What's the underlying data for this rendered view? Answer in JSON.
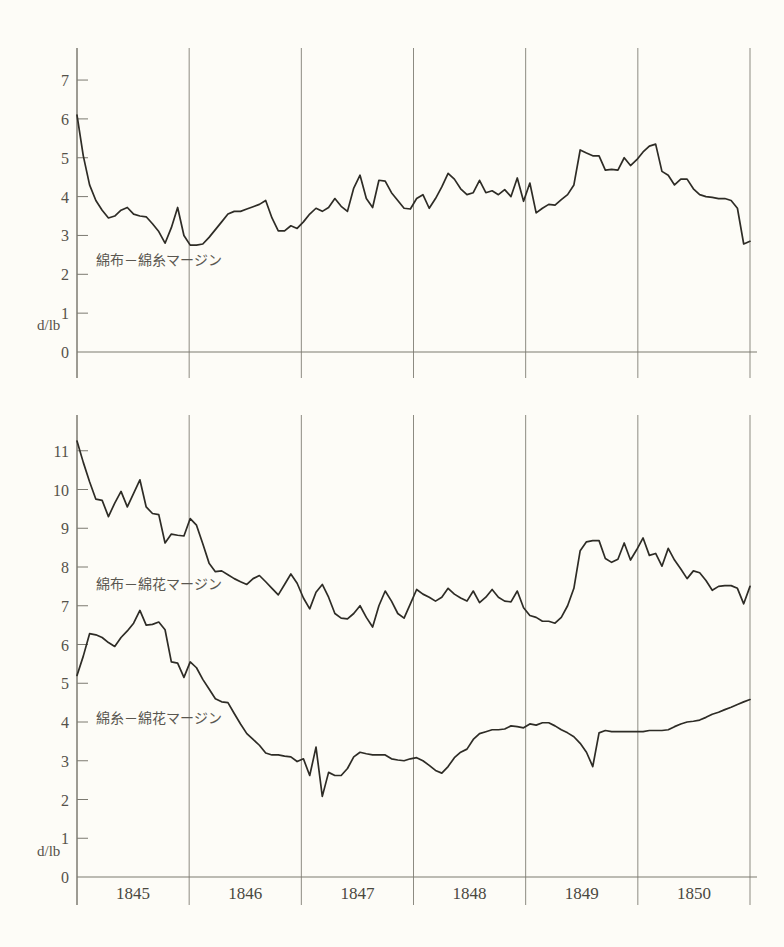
{
  "figure": {
    "unit_label": "d/lb",
    "x_axis_years": [
      "1845",
      "1846",
      "1847",
      "1848",
      "1849",
      "1850"
    ]
  },
  "panels": [
    {
      "name": "top-panel",
      "series_label": "綿布－綿糸マージン",
      "y_ticks": [
        "0",
        "1",
        "2",
        "3",
        "4",
        "5",
        "6",
        "7"
      ]
    },
    {
      "name": "bottom-panel",
      "series_label_upper": "綿布－綿花マージン",
      "series_label_lower": "綿糸－綿花マージン",
      "y_ticks": [
        "0",
        "1",
        "2",
        "3",
        "4",
        "5",
        "6",
        "7",
        "8",
        "9",
        "10",
        "11"
      ]
    }
  ],
  "chart_data": [
    {
      "type": "line",
      "title": "",
      "panel": "top",
      "xlabel": "",
      "ylabel": "d/lb",
      "xlim": [
        1845.0,
        1851.0
      ],
      "ylim": [
        0,
        7.6
      ],
      "grid": true,
      "gridline_years": [
        1845,
        1846,
        1847,
        1848,
        1849,
        1850,
        1851
      ],
      "legend_position": "inline-left",
      "series": [
        {
          "name": "綿布－綿糸マージン",
          "values": [
            6.1,
            5.05,
            4.3,
            3.9,
            3.65,
            3.45,
            3.5,
            3.65,
            3.72,
            3.55,
            3.5,
            3.48,
            3.3,
            3.1,
            2.8,
            3.2,
            3.72,
            3.0,
            2.75,
            2.75,
            2.78,
            2.95,
            3.15,
            3.35,
            3.55,
            3.62,
            3.62,
            3.68,
            3.74,
            3.8,
            3.9,
            3.45,
            3.12,
            3.12,
            3.25,
            3.18,
            3.35,
            3.55,
            3.7,
            3.62,
            3.72,
            3.95,
            3.75,
            3.62,
            4.22,
            4.55,
            3.95,
            3.72,
            4.42,
            4.4,
            4.1,
            3.9,
            3.7,
            3.68,
            3.95,
            4.05,
            3.7,
            3.95,
            4.25,
            4.6,
            4.45,
            4.2,
            4.05,
            4.1,
            4.42,
            4.1,
            4.15,
            4.05,
            4.18,
            4.0,
            4.48,
            3.88,
            4.35,
            3.58,
            3.7,
            3.8,
            3.78,
            3.92,
            4.05,
            4.3,
            5.2,
            5.12,
            5.05,
            5.05,
            4.68,
            4.7,
            4.68,
            5.0,
            4.8,
            4.95,
            5.15,
            5.3,
            5.35,
            4.65,
            4.55,
            4.3,
            4.45,
            4.45,
            4.2,
            4.05,
            4.0,
            3.98,
            3.95,
            3.95,
            3.9,
            3.7,
            2.78,
            2.85
          ]
        }
      ]
    },
    {
      "type": "line",
      "title": "",
      "panel": "bottom",
      "xlabel": "",
      "ylabel": "d/lb",
      "xlim": [
        1845.0,
        1851.0
      ],
      "ylim": [
        0,
        11.6
      ],
      "grid": true,
      "gridline_years": [
        1845,
        1846,
        1847,
        1848,
        1849,
        1850,
        1851
      ],
      "legend_position": "inline-left",
      "series": [
        {
          "name": "綿布－綿花マージン",
          "values": [
            11.25,
            10.7,
            10.2,
            9.75,
            9.72,
            9.3,
            9.65,
            9.95,
            9.55,
            9.9,
            10.25,
            9.55,
            9.38,
            9.35,
            8.62,
            8.85,
            8.82,
            8.8,
            9.25,
            9.08,
            8.6,
            8.1,
            7.88,
            7.9,
            7.8,
            7.7,
            7.62,
            7.55,
            7.7,
            7.78,
            7.62,
            7.45,
            7.28,
            7.55,
            7.82,
            7.58,
            7.2,
            6.92,
            7.35,
            7.55,
            7.22,
            6.8,
            6.68,
            6.66,
            6.8,
            7.0,
            6.7,
            6.45,
            7.0,
            7.38,
            7.12,
            6.8,
            6.68,
            7.05,
            7.42,
            7.3,
            7.22,
            7.12,
            7.22,
            7.45,
            7.3,
            7.2,
            7.12,
            7.38,
            7.08,
            7.22,
            7.42,
            7.22,
            7.12,
            7.1,
            7.38,
            6.95,
            6.75,
            6.7,
            6.6,
            6.6,
            6.55,
            6.7,
            7.0,
            7.45,
            8.42,
            8.65,
            8.68,
            8.68,
            8.22,
            8.12,
            8.2,
            8.62,
            8.18,
            8.45,
            8.75,
            8.3,
            8.35,
            8.02,
            8.48,
            8.18,
            7.95,
            7.7,
            7.9,
            7.85,
            7.65,
            7.4,
            7.5,
            7.52,
            7.52,
            7.45,
            7.05,
            7.5
          ]
        },
        {
          "name": "綿糸－綿花マージン",
          "values": [
            5.2,
            5.7,
            6.28,
            6.25,
            6.18,
            6.05,
            5.95,
            6.18,
            6.35,
            6.55,
            6.88,
            6.5,
            6.52,
            6.58,
            6.38,
            5.55,
            5.52,
            5.15,
            5.55,
            5.4,
            5.1,
            4.85,
            4.6,
            4.52,
            4.5,
            4.22,
            3.95,
            3.7,
            3.55,
            3.4,
            3.2,
            3.15,
            3.15,
            3.12,
            3.1,
            2.98,
            3.05,
            2.62,
            3.35,
            2.08,
            2.7,
            2.62,
            2.62,
            2.8,
            3.1,
            3.22,
            3.18,
            3.15,
            3.15,
            3.15,
            3.05,
            3.02,
            3.0,
            3.05,
            3.08,
            3.0,
            2.88,
            2.75,
            2.68,
            2.85,
            3.08,
            3.22,
            3.3,
            3.55,
            3.7,
            3.75,
            3.8,
            3.8,
            3.82,
            3.9,
            3.88,
            3.85,
            3.95,
            3.92,
            3.98,
            3.98,
            3.9,
            3.8,
            3.72,
            3.62,
            3.45,
            3.22,
            2.85,
            3.72,
            3.78,
            3.75,
            3.75,
            3.75,
            3.75,
            3.75,
            3.75,
            3.78,
            3.78,
            3.78,
            3.8,
            3.88,
            3.95,
            4.0,
            4.02,
            4.05,
            4.12,
            4.2,
            4.25,
            4.32,
            4.38,
            4.45,
            4.52,
            4.58
          ]
        }
      ]
    }
  ]
}
